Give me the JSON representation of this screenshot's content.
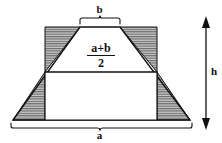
{
  "figure": {
    "type": "geometry-diagram"
  },
  "labels": {
    "top_base": "b",
    "bottom_base": "a",
    "height": "h",
    "midsegment_numerator": "a+b",
    "midsegment_denominator": "2"
  },
  "colors": {
    "stroke": "#111111",
    "hatch": "#6f6f6f",
    "hatch_background": "#c9c9c9",
    "background": "#ffffff"
  },
  "geometry": {
    "trapezoid": {
      "top_left": [
        80,
        27
      ],
      "top_right": [
        120,
        27
      ],
      "bottom_right": [
        190,
        120
      ],
      "bottom_left": [
        13,
        120
      ]
    },
    "inner_rectangle": {
      "left": 45,
      "right": 157,
      "top": 72,
      "bottom": 120
    },
    "shaded_triangles": [
      {
        "name": "upper-left-shaded-triangle",
        "points": [
          [
            45,
            27
          ],
          [
            80,
            27
          ],
          [
            45,
            72
          ]
        ]
      },
      {
        "name": "lower-left-shaded-triangle",
        "points": [
          [
            45,
            72
          ],
          [
            45,
            120
          ],
          [
            13,
            120
          ]
        ]
      },
      {
        "name": "upper-right-shaded-triangle",
        "points": [
          [
            120,
            27
          ],
          [
            157,
            27
          ],
          [
            157,
            72
          ]
        ]
      },
      {
        "name": "lower-right-shaded-triangle",
        "points": [
          [
            157,
            72
          ],
          [
            190,
            120
          ],
          [
            157,
            120
          ]
        ]
      }
    ],
    "height_arrow": {
      "x": 206,
      "top": 20,
      "bottom": 126
    },
    "top_brace": {
      "left": 80,
      "right": 120,
      "y": 22
    },
    "bottom_brace": {
      "left": 11,
      "right": 192,
      "y": 124
    }
  }
}
